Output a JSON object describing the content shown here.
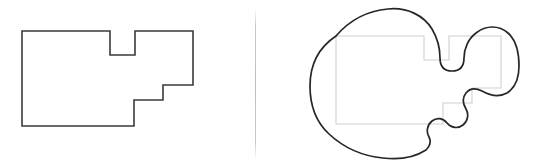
{
  "figure": {
    "background_color": "#ffffff",
    "width": 533,
    "height": 167,
    "panel_count": 2
  },
  "divider": {
    "name": "vertical-divider",
    "color": "#bdbdbd",
    "orientation": "vertical",
    "x": 255
  },
  "left_panel": {
    "label": "Rectilinear polygon",
    "shape_name": "orthogonal-staircase-polygon",
    "stroke_color": "#3a3a3a",
    "fill_color": "none",
    "stroke_width": 1.6,
    "vertex_count": 12,
    "vertices": [
      [
        22,
        31
      ],
      [
        110,
        31
      ],
      [
        110,
        55
      ],
      [
        135,
        55
      ],
      [
        135,
        31
      ],
      [
        193,
        31
      ],
      [
        193,
        85
      ],
      [
        163,
        85
      ],
      [
        163,
        100
      ],
      [
        134,
        100
      ],
      [
        134,
        126
      ],
      [
        22,
        126
      ]
    ],
    "path": "M22,31 L110,31 L110,55 L135,55 L135,31 L193,31 L193,85 L163,85 L163,100 L134,100 L134,126 L22,126 Z"
  },
  "right_panel": {
    "label": "Smoothed blob outline",
    "shape_name": "smoothed-blob-outline",
    "stroke_color": "#262626",
    "fill_color": "none",
    "stroke_width": 1.7,
    "ghost_shape_name": "underlying-polygon-guide",
    "ghost_stroke_color": "#d0d0d0",
    "ghost_path": "M336,36 L424,36 L424,60 L449,60 L449,36 L501,36 L501,88 L472,88 L472,103 L443,103 L443,124 L336,124 Z",
    "blob_path": "M336,36 C348,22 365,11 388,9 C408,7 424,16 432,29 C438,39 440,50 440,58 C440,66 444,71 452,71 C460,71 464,66 464,58 C464,49 468,39 476,33 C486,25 499,25 508,33 C517,41 519,54 519,66 C519,78 515,88 507,93 C498,98 489,95 482,91 C476,88 470,88 466,93 C462,98 463,104 466,109 C469,114 468,121 463,125 C458,129 451,128 447,123 C443,118 437,117 432,121 C427,125 426,132 429,137 C431,141 430,146 426,150 C415,157 399,160 383,158 C362,156 343,147 329,134 C316,122 310,104 310,86 C310,66 318,48 336,36 Z"
  }
}
